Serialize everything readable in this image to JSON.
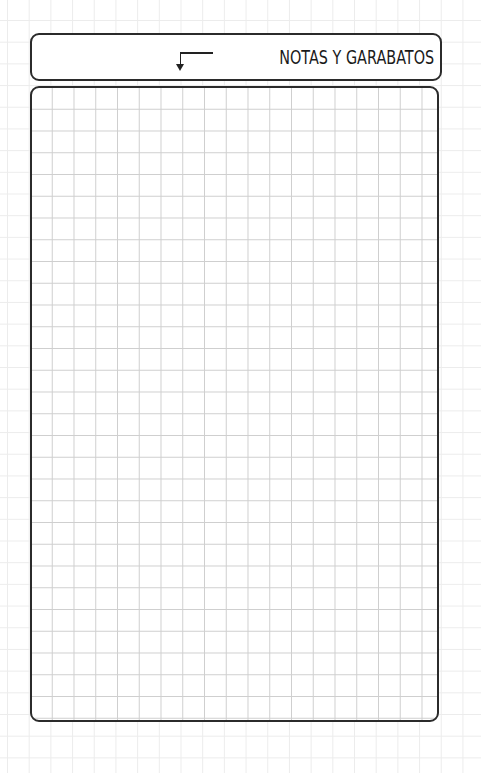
{
  "header": {
    "title": "NOTAS Y GARABATOS",
    "icon": "arrow-down-left-icon"
  },
  "notes_area": {
    "type": "grid-paper",
    "content": ""
  },
  "colors": {
    "border": "#2b2b2b",
    "inner_grid": "#cfcfcf",
    "outer_grid": "#ececec",
    "background": "#ffffff"
  }
}
